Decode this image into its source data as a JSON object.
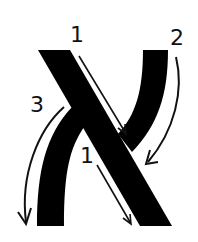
{
  "diagram": {
    "type": "stroke-order",
    "glyph": "X",
    "colors": {
      "glyph": "#000000",
      "arrows": "#111111",
      "background": "#ffffff"
    },
    "strokes": [
      {
        "order": "1",
        "description": "main diagonal from top-left to bottom-right",
        "direction": "down-right"
      },
      {
        "order": "2",
        "description": "right arm curving from top-right down to the crossing",
        "direction": "down-left"
      },
      {
        "order": "3",
        "description": "left leg curving from the crossing down to bottom-left",
        "direction": "down"
      }
    ],
    "labels": {
      "stroke1_top": "1",
      "stroke2": "2",
      "stroke3": "3",
      "stroke1_bottom": "1"
    }
  }
}
